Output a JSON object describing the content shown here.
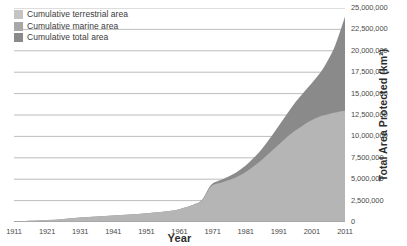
{
  "chart_data": {
    "type": "area",
    "title": "",
    "xlabel": "Year",
    "ylabel": "Total Area Protected (km²)",
    "xlim": [
      1911,
      2011
    ],
    "ylim": [
      0,
      25000000
    ],
    "grid": true,
    "legend_position": "top-left",
    "stacked": true,
    "x_ticks": [
      "1911",
      "1921",
      "1931",
      "1941",
      "1951",
      "1961",
      "1971",
      "1981",
      "1991",
      "2001",
      "2011"
    ],
    "x_tick_values": [
      1911,
      1921,
      1931,
      1941,
      1951,
      1961,
      1971,
      1981,
      1991,
      2001,
      2011
    ],
    "y_ticks": [
      "0",
      "2,500,000",
      "5,000,000",
      "7,500,000",
      "10,000,000",
      "12,500,000",
      "15,000,000",
      "17,500,000",
      "20,000,000",
      "22,500,000",
      "25,000,000"
    ],
    "y_tick_values": [
      0,
      2500000,
      5000000,
      7500000,
      10000000,
      12500000,
      15000000,
      17500000,
      20000000,
      22500000,
      25000000
    ],
    "legend": [
      {
        "name": "Cumulative terrestrial area",
        "color": "#c4c4c4"
      },
      {
        "name": "Cumulative marine area",
        "color": "#a8a8a8"
      },
      {
        "name": "Cumulative total area",
        "color": "#8a8a8a"
      }
    ],
    "x": [
      1911,
      1916,
      1921,
      1926,
      1931,
      1936,
      1941,
      1946,
      1951,
      1956,
      1961,
      1966,
      1968,
      1970,
      1971,
      1972,
      1974,
      1976,
      1978,
      1980,
      1982,
      1984,
      1986,
      1988,
      1990,
      1992,
      1994,
      1996,
      1998,
      2000,
      2002,
      2004,
      2006,
      2008,
      2010,
      2011
    ],
    "series": [
      {
        "name": "Cumulative terrestrial area",
        "color": "#b5b5b5",
        "values": [
          80000,
          140000,
          220000,
          360000,
          520000,
          640000,
          760000,
          880000,
          1020000,
          1200000,
          1500000,
          2100000,
          2600000,
          3900000,
          4300000,
          4450000,
          4650000,
          4900000,
          5200000,
          5600000,
          6100000,
          6700000,
          7300000,
          8000000,
          8700000,
          9400000,
          10100000,
          10700000,
          11200000,
          11700000,
          12100000,
          12400000,
          12600000,
          12800000,
          12950000,
          13000000
        ]
      },
      {
        "name": "Cumulative total area",
        "color": "#8a8a8a",
        "values": [
          80000,
          140000,
          220000,
          360000,
          520000,
          640000,
          760000,
          880000,
          1020000,
          1200000,
          1500000,
          2150000,
          2700000,
          4050000,
          4500000,
          4700000,
          5000000,
          5350000,
          5750000,
          6300000,
          6950000,
          7700000,
          8600000,
          9600000,
          10700000,
          11800000,
          12900000,
          14000000,
          14900000,
          15800000,
          16700000,
          17700000,
          19000000,
          20600000,
          22800000,
          24000000
        ]
      }
    ]
  }
}
